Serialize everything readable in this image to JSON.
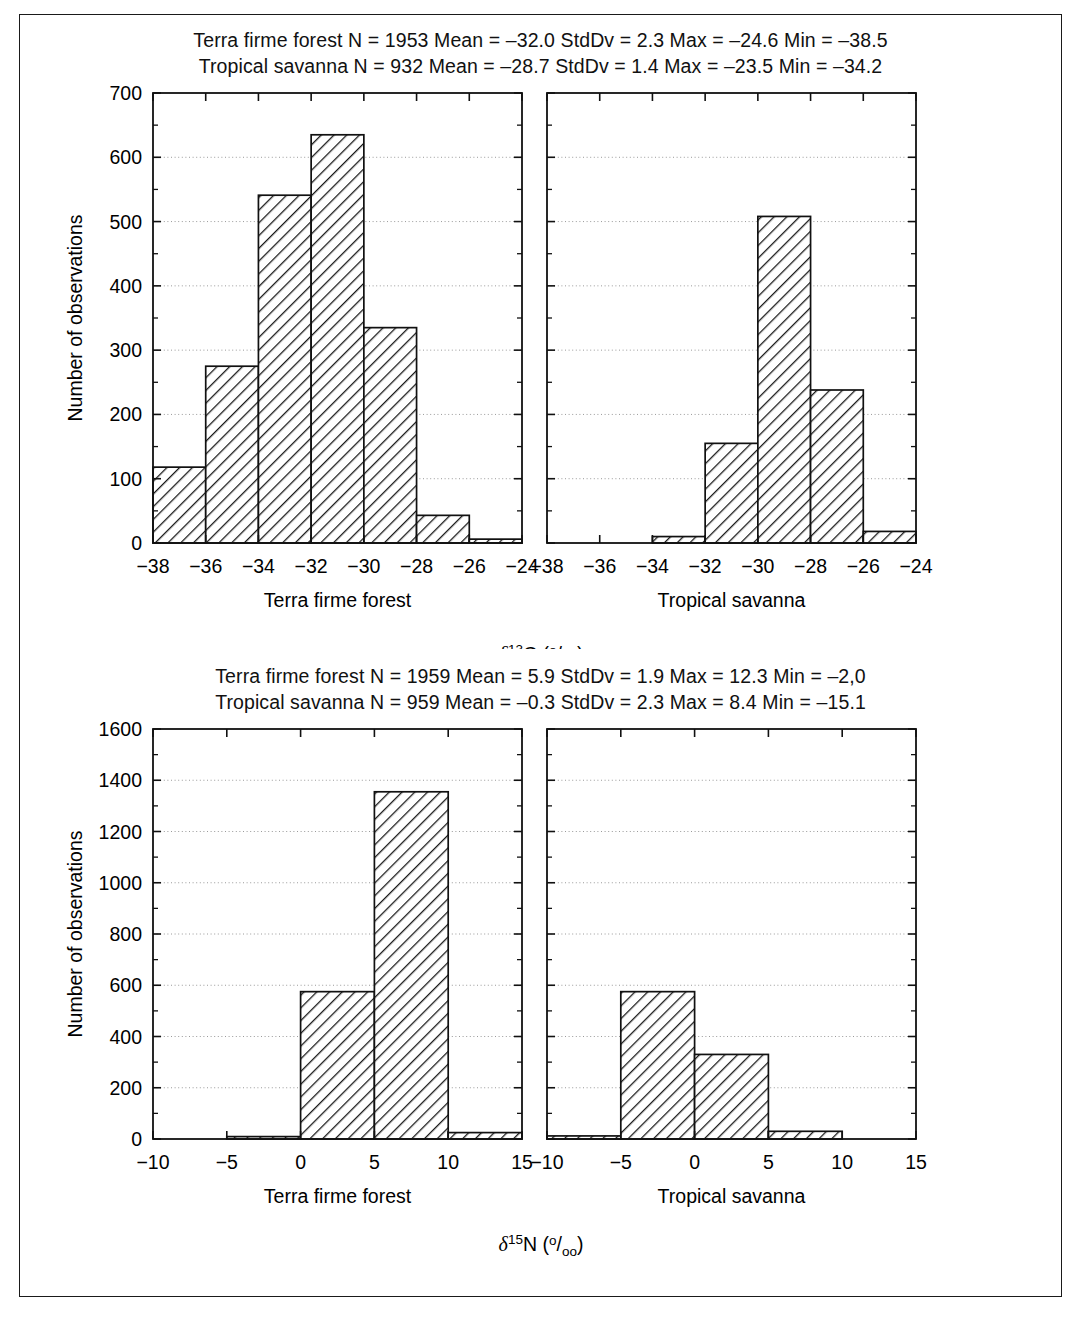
{
  "figure": {
    "panels": [
      {
        "id": "carbon",
        "stat_lines": [
          "Terra firme forest N = 1953 Mean = –32.0 StdDv = 2.3 Max = –24.6 Min = –38.5",
          "Tropical savanna N = 932 Mean = –28.7 StdDv = 1.4 Max = –23.5 Min = –34.2"
        ],
        "ylabel": "Number of observations",
        "axis_title_main": "δ",
        "axis_title_sup": "13",
        "axis_title_iso": "C",
        "axis_title_unit": "(º/ₒₒ)",
        "left_panel_label": "Terra firme forest",
        "right_panel_label": "Tropical savanna",
        "yticks": [
          0,
          100,
          200,
          300,
          400,
          500,
          600,
          700
        ],
        "ylim": [
          0,
          700
        ],
        "xticks": [
          -38,
          -36,
          -34,
          -32,
          -30,
          -28,
          -26,
          -24
        ],
        "xlim": [
          -38,
          -24
        ]
      },
      {
        "id": "nitrogen",
        "stat_lines": [
          "Terra firme forest N = 1959 Mean = 5.9 StdDv = 1.9 Max = 12.3 Min = –2,0",
          "Tropical savanna N = 959 Mean = –0.3 StdDv = 2.3 Max = 8.4 Min = –15.1"
        ],
        "ylabel": "Number of observations",
        "axis_title_main": "δ",
        "axis_title_sup": "15",
        "axis_title_iso": "N",
        "axis_title_unit": "(º/ₒₒ)",
        "left_panel_label": "Terra firme forest",
        "right_panel_label": "Tropical savanna",
        "yticks": [
          0,
          200,
          400,
          600,
          800,
          1000,
          1200,
          1400,
          1600
        ],
        "ylim": [
          0,
          1600
        ],
        "xticks_left": [
          -10,
          -5,
          0,
          5,
          10,
          15
        ],
        "xlim_left": [
          -10,
          15
        ],
        "xticks_right": [
          -10,
          -5,
          0,
          5,
          10,
          15
        ],
        "xlim_right": [
          -10,
          15
        ]
      }
    ]
  },
  "chart_data": [
    {
      "type": "bar",
      "id": "c13-terra-firme-forest",
      "title": "Terra firme forest N = 1953 Mean = –32.0 StdDv = 2.3 Max = –24.6 Min = –38.5",
      "xlabel": "δ13C (‰) — Terra firme forest",
      "ylabel": "Number of observations",
      "xlim": [
        -38,
        -24
      ],
      "ylim": [
        0,
        700
      ],
      "grid": true,
      "bin_width": 2,
      "bin_edges": [
        -38,
        -36,
        -34,
        -32,
        -30,
        -28,
        -26,
        -24
      ],
      "categories": [
        "−38 to −36",
        "−36 to −34",
        "−34 to −32",
        "−32 to −30",
        "−30 to −28",
        "−28 to −26",
        "−26 to −24"
      ],
      "values": [
        118,
        275,
        541,
        635,
        335,
        43,
        6
      ]
    },
    {
      "type": "bar",
      "id": "c13-tropical-savanna",
      "title": "Tropical savanna N = 932 Mean = –28.7 StdDv = 1.4 Max = –23.5 Min = –34.2",
      "xlabel": "δ13C (‰) — Tropical savanna",
      "ylabel": "Number of observations",
      "xlim": [
        -38,
        -24
      ],
      "ylim": [
        0,
        700
      ],
      "grid": true,
      "bin_width": 2,
      "bin_edges": [
        -38,
        -36,
        -34,
        -32,
        -30,
        -28,
        -26,
        -24
      ],
      "categories": [
        "−38 to −36",
        "−36 to −34",
        "−34 to −32",
        "−32 to −30",
        "−30 to −28",
        "−28 to −26",
        "−26 to −24"
      ],
      "values": [
        0,
        0,
        10,
        155,
        508,
        238,
        18
      ]
    },
    {
      "type": "bar",
      "id": "n15-terra-firme-forest",
      "title": "Terra firme forest N = 1959 Mean = 5.9 StdDv = 1.9 Max = 12.3 Min = –2,0",
      "xlabel": "δ15N (‰) — Terra firme forest",
      "ylabel": "Number of observations",
      "xlim": [
        -10,
        15
      ],
      "ylim": [
        0,
        1600
      ],
      "grid": true,
      "bin_width": 5,
      "bin_edges": [
        -10,
        -5,
        0,
        5,
        10,
        15
      ],
      "categories": [
        "−10 to −5",
        "−5 to 0",
        "0 to 5",
        "5 to 10",
        "10 to 15"
      ],
      "values": [
        0,
        4,
        575,
        1355,
        25
      ]
    },
    {
      "type": "bar",
      "id": "n15-tropical-savanna",
      "title": "Tropical savanna N = 959 Mean = –0.3 StdDv = 2.3 Max = 8.4 Min = –15.1",
      "xlabel": "δ15N (‰) — Tropical savanna",
      "ylabel": "Number of observations",
      "xlim": [
        -10,
        15
      ],
      "ylim": [
        0,
        1600
      ],
      "grid": true,
      "bin_width": 5,
      "bin_edges": [
        -10,
        -5,
        0,
        5,
        10,
        15
      ],
      "categories": [
        "−10 to −5",
        "−5 to 0",
        "0 to 5",
        "5 to 10",
        "10 to 15"
      ],
      "values": [
        12,
        575,
        330,
        30,
        0
      ]
    }
  ]
}
